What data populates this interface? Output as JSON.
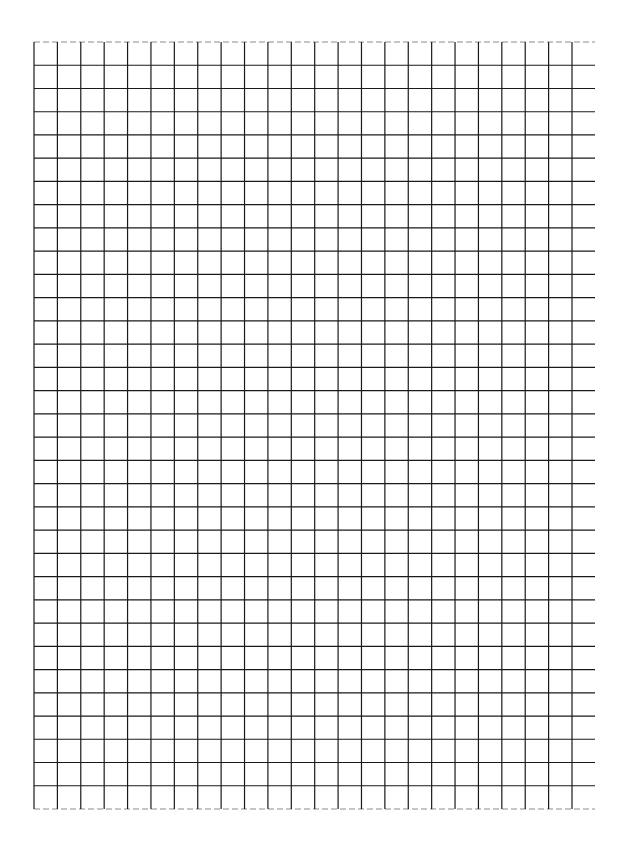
{
  "page": {
    "type": "graph-paper",
    "background": "#ffffff",
    "line_color": "#1a1a1a"
  },
  "grid": {
    "left": 34,
    "top": 42,
    "right_line_end": 595,
    "last_vertical": 572,
    "bottom": 809,
    "columns": 23,
    "rows": 33
  }
}
